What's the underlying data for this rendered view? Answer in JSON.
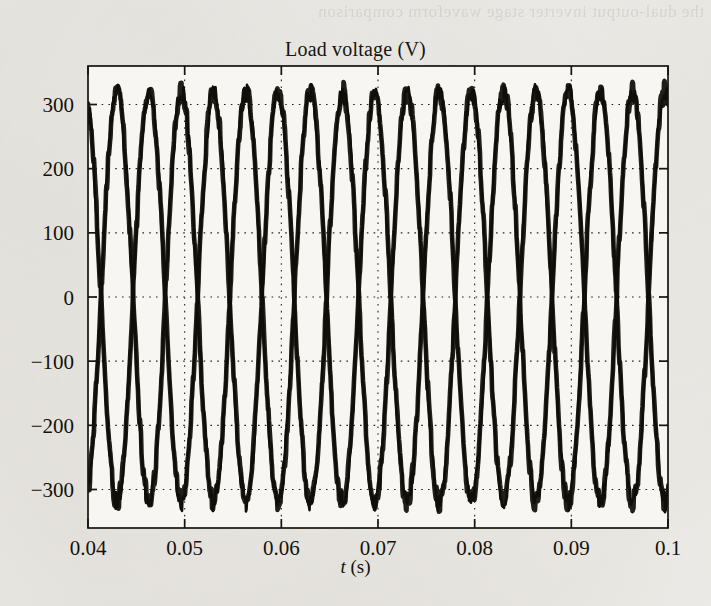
{
  "page": {
    "background_color": "#f2f1ee",
    "bleed_through_text": "the dual-output inverter stage waveform comparison"
  },
  "chart_data": {
    "type": "line",
    "title": "Load voltage (V)",
    "xlabel": "t (s)",
    "xlabel_symbol": "t",
    "xlabel_unit": "(s)",
    "ylabel": "",
    "xlim": [
      0.04,
      0.1
    ],
    "ylim": [
      -360,
      360
    ],
    "xticks": [
      0.04,
      0.05,
      0.06,
      0.07,
      0.08,
      0.09,
      0.1
    ],
    "xticklabels": [
      "0.04",
      "0.05",
      "0.06",
      "0.07",
      "0.08",
      "0.09",
      "0.1"
    ],
    "yticks": [
      300,
      200,
      100,
      0,
      -100,
      -200,
      -300
    ],
    "yticklabels": [
      "300",
      "200",
      "100",
      "0",
      "−100",
      "−200",
      "−300"
    ],
    "grid": true,
    "grid_style": "dotted",
    "legend": null,
    "trace_color": "#100e08",
    "amplitude": 320,
    "frequency_hz": 150,
    "noise_amplitude": 14,
    "series": [
      {
        "name": "phase-a",
        "phase_deg": 108,
        "amplitude": 320
      },
      {
        "name": "phase-b",
        "phase_deg": 288,
        "amplitude": 320
      }
    ]
  }
}
